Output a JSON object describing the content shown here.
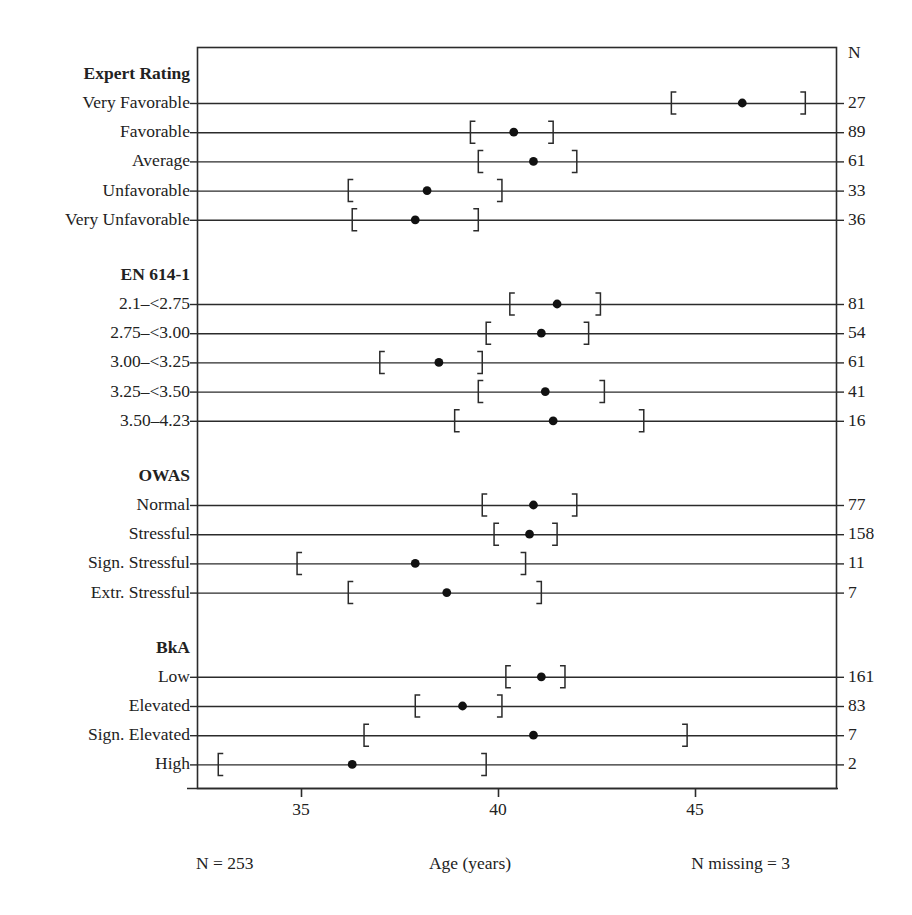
{
  "chart_data": {
    "type": "scatter",
    "title": "",
    "xlabel": "Age (years)",
    "ylabel": "",
    "xlim": [
      32.36,
      48.58
    ],
    "xticks": [
      35,
      40,
      45
    ],
    "xticklabels": [
      "35",
      "40",
      "45"
    ],
    "grid": false,
    "legend": "none",
    "n_column_header": "N",
    "footer_left": "N = 253",
    "footer_center": "Age (years)",
    "footer_right": "N missing = 3",
    "groups": [
      {
        "name": "Expert Rating",
        "rows": [
          {
            "label": "Very Favorable",
            "mean": 46.2,
            "ci_low": 44.4,
            "ci_high": 47.8,
            "n": "27"
          },
          {
            "label": "Favorable",
            "mean": 40.4,
            "ci_low": 39.3,
            "ci_high": 41.4,
            "n": "89"
          },
          {
            "label": "Average",
            "mean": 40.9,
            "ci_low": 39.5,
            "ci_high": 42.0,
            "n": "61"
          },
          {
            "label": "Unfavorable",
            "mean": 38.2,
            "ci_low": 36.2,
            "ci_high": 40.1,
            "n": "33"
          },
          {
            "label": "Very Unfavorable",
            "mean": 37.9,
            "ci_low": 36.3,
            "ci_high": 39.5,
            "n": "36"
          }
        ]
      },
      {
        "name": "EN 614-1",
        "rows": [
          {
            "label": "2.1–<2.75",
            "mean": 41.5,
            "ci_low": 40.3,
            "ci_high": 42.6,
            "n": "81"
          },
          {
            "label": "2.75–<3.00",
            "mean": 41.1,
            "ci_low": 39.7,
            "ci_high": 42.3,
            "n": "54"
          },
          {
            "label": "3.00–<3.25",
            "mean": 38.5,
            "ci_low": 37.0,
            "ci_high": 39.6,
            "n": "61"
          },
          {
            "label": "3.25–<3.50",
            "mean": 41.2,
            "ci_low": 39.5,
            "ci_high": 42.7,
            "n": "41"
          },
          {
            "label": "3.50–4.23",
            "mean": 41.4,
            "ci_low": 38.9,
            "ci_high": 43.7,
            "n": "16"
          }
        ]
      },
      {
        "name": "OWAS",
        "rows": [
          {
            "label": "Normal",
            "mean": 40.9,
            "ci_low": 39.6,
            "ci_high": 42.0,
            "n": "77"
          },
          {
            "label": "Stressful",
            "mean": 40.8,
            "ci_low": 39.9,
            "ci_high": 41.5,
            "n": "158"
          },
          {
            "label": "Sign. Stressful",
            "mean": 37.9,
            "ci_low": 34.9,
            "ci_high": 40.7,
            "n": "11"
          },
          {
            "label": "Extr. Stressful",
            "mean": 38.7,
            "ci_low": 36.2,
            "ci_high": 41.1,
            "n": "7"
          }
        ]
      },
      {
        "name": "BkA",
        "rows": [
          {
            "label": "Low",
            "mean": 41.1,
            "ci_low": 40.2,
            "ci_high": 41.7,
            "n": "161"
          },
          {
            "label": "Elevated",
            "mean": 39.1,
            "ci_low": 37.9,
            "ci_high": 40.1,
            "n": "83"
          },
          {
            "label": "Sign. Elevated",
            "mean": 40.9,
            "ci_low": 36.6,
            "ci_high": 44.8,
            "n": "7"
          },
          {
            "label": "High",
            "mean": 36.3,
            "ci_low": 32.9,
            "ci_high": 39.7,
            "n": "2"
          }
        ]
      }
    ]
  },
  "style": {
    "line_color": "#2b2b2b",
    "dot_color": "#111111",
    "text_color": "#1a1a1a"
  }
}
